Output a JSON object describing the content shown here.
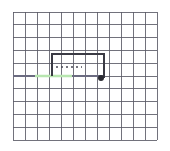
{
  "figure": {
    "title": "",
    "background_color": "#ffffff",
    "width": 170,
    "height": 151
  },
  "grid": {
    "name": "graph-paper-grid",
    "color": "#5a5a66",
    "line_width": 1,
    "x_start": 13,
    "x_end": 157,
    "y_start": 12,
    "y_end": 140,
    "cell_width": 12,
    "cell_height": 12.8,
    "columns": 12,
    "rows": 10,
    "vertical_lines": [
      13,
      25,
      37,
      49,
      61,
      73,
      85,
      97,
      109,
      121,
      133,
      145,
      157
    ],
    "horizontal_lines": [
      12,
      24.8,
      37.6,
      50.4,
      63.2,
      76,
      88.8,
      101.6,
      114.4,
      127.2,
      140
    ]
  },
  "path": {
    "name": "u-shaped-path",
    "color": "#3a3a44",
    "line_width": 2,
    "description": "open rectangle path: up from left, across top, down to dot marker",
    "points": [
      {
        "x": 52,
        "y": 76
      },
      {
        "x": 52,
        "y": 54
      },
      {
        "x": 104,
        "y": 54
      },
      {
        "x": 104,
        "y": 78
      }
    ]
  },
  "dotted_segment": {
    "name": "dotted-guide-line",
    "color": "#4a4a55",
    "y": 67,
    "x_start": 56,
    "x_end": 82,
    "dash": "2 3",
    "line_width": 1.6
  },
  "green_segment": {
    "name": "green-highlight-segment",
    "color": "#b8e6b0",
    "y": 76,
    "x_start": 35,
    "x_end": 72,
    "line_width": 2.6
  },
  "axis_line": {
    "name": "center-horizontal-axis",
    "color": "#6b6b80",
    "y": 76,
    "x_start": 13,
    "x_end": 104,
    "line_width": 1.4
  },
  "marker": {
    "name": "endpoint-dot-marker",
    "color": "#2b2b33",
    "x": 101,
    "y": 78,
    "radius": 3
  }
}
